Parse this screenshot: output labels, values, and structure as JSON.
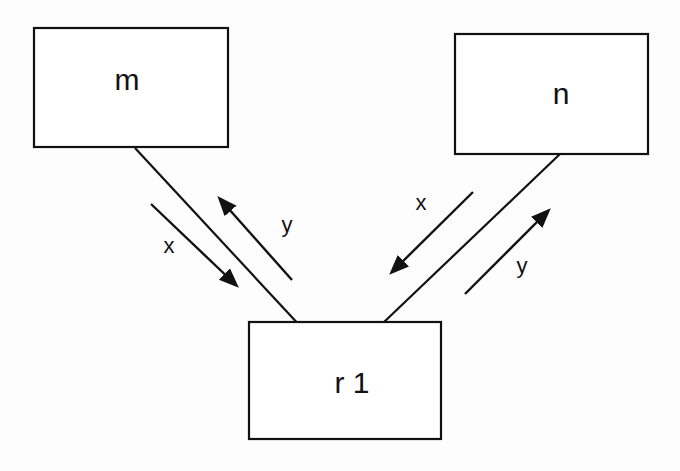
{
  "diagram": {
    "nodes": [
      {
        "id": "m",
        "label": "m",
        "x": 34,
        "y": 28,
        "w": 194,
        "h": 119
      },
      {
        "id": "n",
        "label": "n",
        "x": 455,
        "y": 34,
        "w": 193,
        "h": 120
      },
      {
        "id": "r1",
        "label": "r 1",
        "x": 249,
        "y": 322,
        "w": 192,
        "h": 117
      }
    ],
    "edges": [
      {
        "from": "m",
        "to": "r1"
      },
      {
        "from": "n",
        "to": "r1"
      }
    ],
    "flows": [
      {
        "edge": "m-r1",
        "label": "x",
        "direction": "m → r1"
      },
      {
        "edge": "m-r1",
        "label": "y",
        "direction": "r1 → m"
      },
      {
        "edge": "n-r1",
        "label": "x",
        "direction": "n → r1"
      },
      {
        "edge": "n-r1",
        "label": "y",
        "direction": "r1 → n"
      }
    ]
  }
}
